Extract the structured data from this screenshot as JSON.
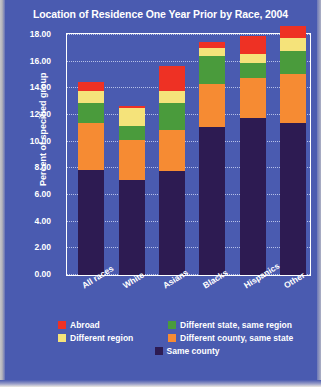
{
  "chart": {
    "title": "Location of Residence One Year Prior by Race, 2004",
    "ylabel": "Percent of specified group"
  },
  "colors": {
    "background": "#4a5bb0",
    "frame": "#ffffff",
    "gridline": "#c9d2f2",
    "abroad": "#ee3124",
    "different_region": "#f5e37a",
    "different_state_same_region": "#4a9b3c",
    "different_county_same_state": "#f68b33",
    "same_county": "#2d1b52"
  },
  "legend": {
    "position": "bottom",
    "items": [
      {
        "label": "Abroad",
        "color": "#ee3124",
        "key": "abroad"
      },
      {
        "label": "Different state, same region",
        "color": "#4a9b3c",
        "key": "different_state_same_region"
      },
      {
        "label": "Different region",
        "color": "#f5e37a",
        "key": "different_region"
      },
      {
        "label": "Different county, same state",
        "color": "#f68b33",
        "key": "different_county_same_state"
      },
      {
        "label": "Same county",
        "color": "#2d1b52",
        "key": "same_county"
      }
    ]
  },
  "chart_data": {
    "type": "bar",
    "stacked": true,
    "title": "Location of Residence One Year Prior by Race, 2004",
    "xlabel": "",
    "ylabel": "Percent of specified group",
    "ylim": [
      0,
      18
    ],
    "yticks": [
      "0.00",
      "2.00",
      "4.00",
      "6.00",
      "8.00",
      "10.00",
      "12.00",
      "14.00",
      "16.00",
      "18.00"
    ],
    "ytick_values": [
      0,
      2,
      4,
      6,
      8,
      10,
      12,
      14,
      16,
      18
    ],
    "grid": true,
    "categories": [
      "All races",
      "White",
      "Asians",
      "Blacks",
      "Hispanics",
      "Other"
    ],
    "series": [
      {
        "name": "Same county",
        "color": "#2d1b52",
        "values": [
          7.9,
          7.1,
          7.8,
          11.1,
          11.8,
          11.4
        ]
      },
      {
        "name": "Different county, same state",
        "color": "#f68b33",
        "values": [
          3.5,
          3.0,
          3.1,
          3.2,
          3.0,
          3.7
        ]
      },
      {
        "name": "Different state, same region",
        "color": "#4a9b3c",
        "values": [
          1.5,
          1.1,
          2.0,
          2.1,
          1.1,
          1.7
        ]
      },
      {
        "name": "Different region",
        "color": "#f5e37a",
        "values": [
          0.9,
          1.3,
          0.9,
          0.6,
          0.7,
          1.0
        ]
      },
      {
        "name": "Abroad",
        "color": "#ee3124",
        "values": [
          0.7,
          0.2,
          1.9,
          0.5,
          1.3,
          0.9
        ]
      }
    ],
    "totals": [
      14.5,
      12.7,
      15.7,
      17.5,
      17.9,
      18.7
    ]
  }
}
